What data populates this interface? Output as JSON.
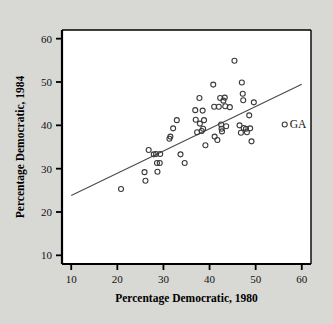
{
  "figure": {
    "background_color": "#d8d8d4",
    "plot_background_color": "#ffffff",
    "axis_color": "#000000",
    "marker_color": "#3a3a3a",
    "line_color": "#4a4a4a"
  },
  "legend": {
    "label": "GA",
    "marker_x": 56.3,
    "marker_y": 40.2
  },
  "chart_data": {
    "type": "scatter",
    "title": "",
    "xlabel": "Percentage Democratic, 1980",
    "ylabel": "Percentage Democratic, 1984",
    "xlim": [
      8,
      62
    ],
    "ylim": [
      8,
      62
    ],
    "xticks": [
      10,
      20,
      30,
      40,
      50,
      60
    ],
    "yticks": [
      10,
      20,
      30,
      40,
      50,
      60
    ],
    "xtick_labels": [
      "10",
      "20",
      "30",
      "40",
      "50",
      "60"
    ],
    "ytick_labels": [
      "10",
      "20",
      "30",
      "40",
      "50",
      "60"
    ],
    "grid": false,
    "legend_position": "right-inside",
    "marker_style": "open-circle",
    "points": [
      [
        20.8,
        25.3
      ],
      [
        25.9,
        29.2
      ],
      [
        26.1,
        27.2
      ],
      [
        26.8,
        34.3
      ],
      [
        27.9,
        33.3
      ],
      [
        28.4,
        33.4
      ],
      [
        28.6,
        31.3
      ],
      [
        28.7,
        29.3
      ],
      [
        29.2,
        31.3
      ],
      [
        29.3,
        33.4
      ],
      [
        31.3,
        36.9
      ],
      [
        31.5,
        37.4
      ],
      [
        32.1,
        39.3
      ],
      [
        32.9,
        41.2
      ],
      [
        33.7,
        33.3
      ],
      [
        34.6,
        31.3
      ],
      [
        36.9,
        43.5
      ],
      [
        37.0,
        41.3
      ],
      [
        37.3,
        38.4
      ],
      [
        37.8,
        46.3
      ],
      [
        37.9,
        40.4
      ],
      [
        38.3,
        38.7
      ],
      [
        38.5,
        43.4
      ],
      [
        38.6,
        39.2
      ],
      [
        38.8,
        41.2
      ],
      [
        39.1,
        35.4
      ],
      [
        40.8,
        49.4
      ],
      [
        41.0,
        44.3
      ],
      [
        41.1,
        37.4
      ],
      [
        41.7,
        36.6
      ],
      [
        42.0,
        44.3
      ],
      [
        42.3,
        46.3
      ],
      [
        42.5,
        40.2
      ],
      [
        42.6,
        39.2
      ],
      [
        42.7,
        38.6
      ],
      [
        43.0,
        45.7
      ],
      [
        43.3,
        46.4
      ],
      [
        43.4,
        44.4
      ],
      [
        43.6,
        39.8
      ],
      [
        44.4,
        44.2
      ],
      [
        45.4,
        54.9
      ],
      [
        46.5,
        40.0
      ],
      [
        46.8,
        38.3
      ],
      [
        47.0,
        49.9
      ],
      [
        47.2,
        47.3
      ],
      [
        47.3,
        45.8
      ],
      [
        47.4,
        39.4
      ],
      [
        47.9,
        39.2
      ],
      [
        48.1,
        38.4
      ],
      [
        48.6,
        42.3
      ],
      [
        48.8,
        39.3
      ],
      [
        49.1,
        36.3
      ],
      [
        49.6,
        45.3
      ]
    ],
    "fit_line": {
      "label": "least-squares line",
      "x_start": 10,
      "y_start": 23.8,
      "x_end": 60,
      "y_end": 49.5
    }
  }
}
